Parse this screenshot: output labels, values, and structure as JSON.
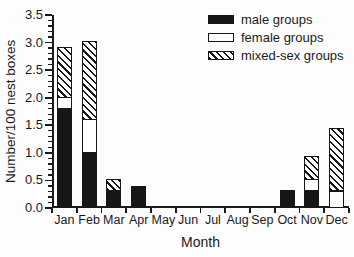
{
  "colors": {
    "ink": "#1a1a1a",
    "male_fill": "#161616",
    "female_fill": "#ffffff",
    "background": "#fdfdfd"
  },
  "y_axis": {
    "label": "Number/100 nest boxes",
    "ticks": [
      "0.0",
      "0.5",
      "1.0",
      "1.5",
      "2.0",
      "2.5",
      "3.0",
      "3.5"
    ],
    "minor_tick_step": 0.1
  },
  "x_axis": {
    "label": "Month"
  },
  "chart_data": {
    "type": "bar",
    "stacked": true,
    "title": "",
    "xlabel": "Month",
    "ylabel": "Number/100 nest boxes",
    "ylim": [
      0,
      3.5
    ],
    "grid": false,
    "legend_position": "top-right",
    "categories": [
      "Jan",
      "Feb",
      "Mar",
      "Apr",
      "May",
      "Jun",
      "Jul",
      "Aug",
      "Sep",
      "Oct",
      "Nov",
      "Dec"
    ],
    "series": [
      {
        "name": "male groups",
        "pattern": "solid",
        "values": [
          1.8,
          1.0,
          0.3,
          0.4,
          0,
          0,
          0,
          0,
          0,
          0.33,
          0.3,
          0
        ]
      },
      {
        "name": "female groups",
        "pattern": "open",
        "values": [
          0.2,
          0.6,
          0,
          0,
          0,
          0,
          0,
          0,
          0,
          0,
          0.2,
          0.3
        ]
      },
      {
        "name": "mixed-sex groups",
        "pattern": "hatch",
        "values": [
          0.9,
          1.4,
          0.2,
          0,
          0,
          0,
          0,
          0,
          0,
          0,
          0.42,
          1.13
        ]
      }
    ]
  }
}
